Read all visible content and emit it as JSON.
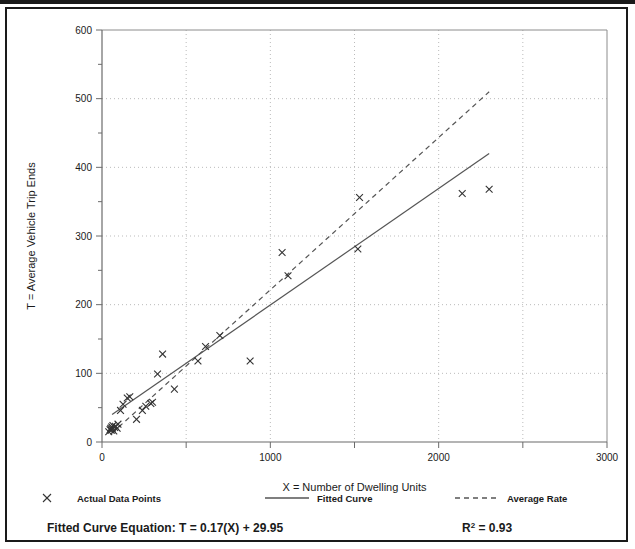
{
  "figure": {
    "border_color": "#1a1a1a",
    "background": "#ffffff"
  },
  "legend": {
    "items": [
      {
        "label": "Actual Data Points",
        "marker": "x-marker-icon",
        "color": "#333333"
      },
      {
        "label": "Fitted Curve",
        "marker": "solid-line-icon",
        "color": "#555555"
      },
      {
        "label": "Average Rate",
        "marker": "dashed-line-icon",
        "color": "#555555"
      }
    ]
  },
  "footer": {
    "equation_label": "Fitted Curve Equation:",
    "equation_value": "T = 0.17(X) + 29.95",
    "r2_base": "R",
    "r2_exponent": "2",
    "r2_value": "= 0.93"
  },
  "chart_data": {
    "type": "scatter",
    "title": "",
    "xlabel": "X = Number of Dwelling Units",
    "ylabel": "T = Average Vehicle Trip Ends",
    "xlim": [
      0,
      3000
    ],
    "ylim": [
      0,
      600
    ],
    "xticks": [
      0,
      500,
      1000,
      1500,
      2000,
      2500,
      3000
    ],
    "xtick_labels": [
      "0",
      "",
      "1000",
      "",
      "2000",
      "",
      "3000"
    ],
    "yticks": [
      0,
      50,
      100,
      150,
      200,
      250,
      300,
      350,
      400,
      450,
      500,
      550,
      600
    ],
    "ytick_labels": [
      "0",
      "",
      "100",
      "",
      "200",
      "",
      "300",
      "",
      "400",
      "",
      "500",
      "",
      "600"
    ],
    "grid": true,
    "grid_style": "dotted",
    "grid_color": "#bbbbbb",
    "legend_position": "below-axes",
    "series": [
      {
        "name": "Actual Data Points",
        "type": "scatter",
        "marker": "x",
        "color": "#333333",
        "points": [
          [
            40,
            15
          ],
          [
            48,
            18
          ],
          [
            52,
            20
          ],
          [
            55,
            17
          ],
          [
            58,
            22
          ],
          [
            62,
            19
          ],
          [
            65,
            24
          ],
          [
            70,
            16
          ],
          [
            75,
            21
          ],
          [
            80,
            23
          ],
          [
            90,
            20
          ],
          [
            95,
            26
          ],
          [
            110,
            46
          ],
          [
            125,
            55
          ],
          [
            150,
            64
          ],
          [
            165,
            66
          ],
          [
            205,
            33
          ],
          [
            240,
            46
          ],
          [
            260,
            52
          ],
          [
            290,
            56
          ],
          [
            300,
            58
          ],
          [
            330,
            99
          ],
          [
            360,
            128
          ],
          [
            430,
            77
          ],
          [
            570,
            118
          ],
          [
            615,
            139
          ],
          [
            700,
            155
          ],
          [
            880,
            118
          ],
          [
            1070,
            276
          ],
          [
            1105,
            242
          ],
          [
            1520,
            281
          ],
          [
            1530,
            356
          ],
          [
            2140,
            362
          ],
          [
            2300,
            368
          ]
        ]
      },
      {
        "name": "Fitted Curve",
        "type": "line",
        "style": "solid",
        "color": "#555555",
        "equation": "T = 0.17(X) + 29.95",
        "r_squared": 0.93,
        "endpoints": [
          [
            60,
            40
          ],
          [
            2300,
            420
          ]
        ]
      },
      {
        "name": "Average Rate",
        "type": "line",
        "style": "dashed",
        "color": "#555555",
        "endpoints": [
          [
            60,
            13
          ],
          [
            2300,
            510
          ]
        ]
      }
    ]
  }
}
